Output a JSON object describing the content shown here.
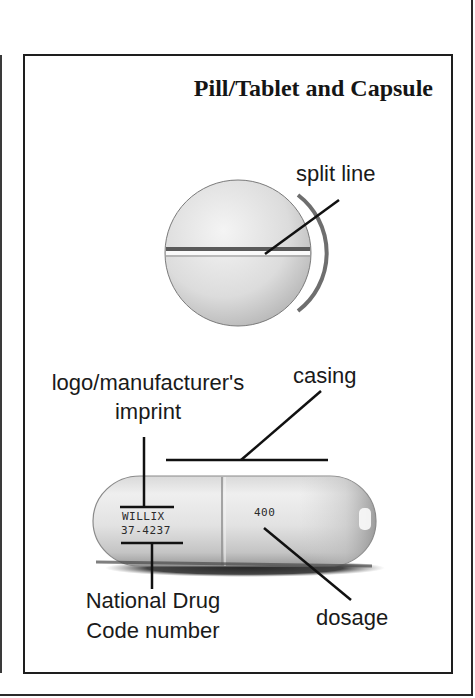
{
  "figure": {
    "title": "Pill/Tablet and Capsule",
    "tablet": {
      "label_split_line": "split line"
    },
    "capsule": {
      "label_casing": "casing",
      "label_logo_line1": "logo/manufacturer's",
      "label_logo_line2": "imprint",
      "label_ndc_line1": "National Drug",
      "label_ndc_line2": "Code number",
      "label_dosage": "dosage",
      "imprint_logo": "WILLIX",
      "imprint_ndc": "37-4237",
      "imprint_dosage": "400"
    }
  },
  "colors": {
    "ink": "#1a1a1a",
    "paper": "#ffffff",
    "shading_light": "#e6e6e6",
    "shading_dark": "#555555"
  }
}
